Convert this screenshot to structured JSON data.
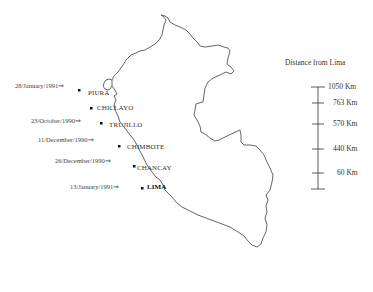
{
  "map": {
    "subject": "Peru outline with coastal cities",
    "outline_color": "#444444"
  },
  "cities": [
    {
      "name": "PIURA",
      "date": "28/January/1991⇒",
      "bold": false
    },
    {
      "name": "CHICLAYO",
      "date": "",
      "bold": false
    },
    {
      "name": "TRUJILLO",
      "date": "23/October/1990⇒",
      "bold": false
    },
    {
      "name": "CHIMBOTE",
      "date": "11/December/1990⇒",
      "bold": false
    },
    {
      "name": "CHANCAY",
      "date": "26/December/1990⇒",
      "bold": false
    },
    {
      "name": "LIMA",
      "date": "13/January/1991⇒",
      "bold": true
    }
  ],
  "legend": {
    "title": "Distance from Lima",
    "ticks": [
      "1050 Km",
      "763 Km",
      "570 Km",
      "440 Km",
      "60 Km"
    ]
  }
}
